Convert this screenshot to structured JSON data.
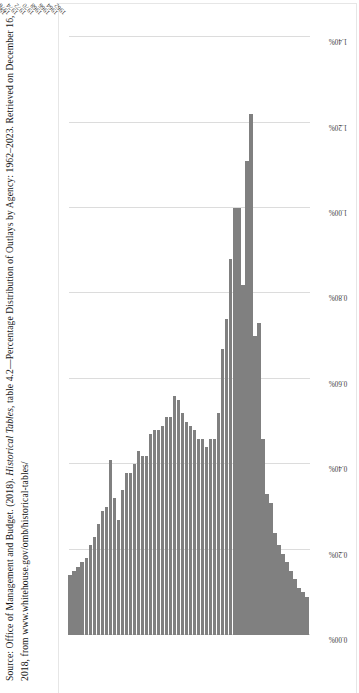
{
  "page": {
    "orientation": "rotated-90-ccw",
    "background": "#ffffff"
  },
  "source_note": {
    "prefix": "Source: Office of Management and Budget. (2018). ",
    "italic_title": "Historical Tables",
    "middle": ", table 4.2—Percentage Distribution of Outlays by Agency: 1962–2023. Retrieved on December 16, 2018, from www.whitehouse.gov/omb/historical-tables/",
    "full_text": "Source: Office of Management and Budget. (2018). Historical Tables, table 4.2—Percentage Distribution of Outlays by Agency: 1962–2023. Retrieved on December 16, 2018, from www.whitehouse.gov/omb/historical-tables/"
  },
  "style": {
    "bar_color": "#808080",
    "gridline_color": "#dcdcdc",
    "frame_color": "#e6e6e6",
    "label_color": "#3a3a3a"
  },
  "chart_data": {
    "type": "bar",
    "orientation": "horizontal",
    "title": "",
    "subtitle": "",
    "xlabel": "",
    "ylabel": "",
    "xlim": [
      0,
      1.45
    ],
    "grid": true,
    "legend": "none",
    "tick_labels": [
      "0.00%",
      "0.20%",
      "0.40%",
      "0.60%",
      "0.80%",
      "1.00%",
      "1.20%",
      "1.40%"
    ],
    "tick_values": [
      0.0,
      0.2,
      0.4,
      0.6,
      0.8,
      1.0,
      1.2,
      1.4
    ],
    "categories": [
      "1962",
      "1963",
      "1964",
      "1965",
      "1966",
      "1967",
      "1968",
      "1969",
      "1970",
      "1971",
      "1972",
      "1973",
      "1974",
      "1975",
      "1976",
      "1977",
      "1978",
      "1979",
      "1980",
      "1981",
      "1982",
      "1983",
      "1984",
      "1985",
      "1986",
      "1987",
      "1988",
      "1989",
      "1990",
      "1991",
      "1992",
      "1993",
      "1994",
      "1995",
      "1996",
      "1997",
      "1998",
      "1999",
      "2000",
      "2001",
      "2002",
      "2003",
      "2004",
      "2005",
      "2006",
      "2007",
      "2008",
      "2009",
      "2010",
      "2011",
      "2012",
      "2013",
      "2014",
      "2015",
      "2016",
      "2017 estimate",
      "2018 estimate",
      "2019 estimate",
      "2020 estimate",
      "2021 estimate"
    ],
    "visible_tick_categories": [
      "1962",
      "1964",
      "1966",
      "1968",
      "1970",
      "1972",
      "1974",
      "1976",
      "1977",
      "1979",
      "1981",
      "1983",
      "1985",
      "1987",
      "1989",
      "1991",
      "1993",
      "1995",
      "1997",
      "1999",
      "2001",
      "2003",
      "2005",
      "2007",
      "2009",
      "2011",
      "2013",
      "2015",
      "2017 estimate",
      "2019 estimate",
      "2021 estimate"
    ],
    "values": [
      0.09,
      0.1,
      0.11,
      0.13,
      0.15,
      0.17,
      0.19,
      0.21,
      0.24,
      0.31,
      0.33,
      0.46,
      0.73,
      0.7,
      1.22,
      1.11,
      0.82,
      1.0,
      1.0,
      0.88,
      0.74,
      0.67,
      0.52,
      0.46,
      0.46,
      0.44,
      0.46,
      0.46,
      0.48,
      0.49,
      0.5,
      0.52,
      0.55,
      0.56,
      0.51,
      0.51,
      0.49,
      0.48,
      0.48,
      0.47,
      0.42,
      0.42,
      0.43,
      0.4,
      0.38,
      0.38,
      0.34,
      0.27,
      0.32,
      0.41,
      0.3,
      0.29,
      0.26,
      0.23,
      0.21,
      0.18,
      0.17,
      0.16,
      0.15,
      0.14
    ]
  }
}
